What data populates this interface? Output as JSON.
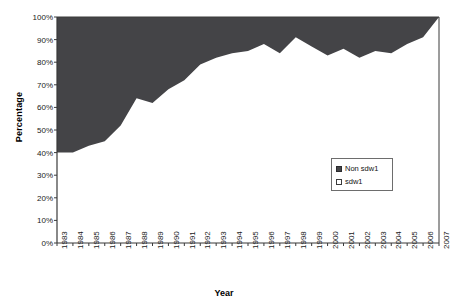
{
  "chart": {
    "type": "area",
    "title": "",
    "xlabel": "Year",
    "ylabel": "Percentage",
    "legend_position": "inside-right",
    "grid": false,
    "ylim": [
      0,
      100
    ],
    "ytick_labels": [
      "100%",
      "90%",
      "80%",
      "70%",
      "60%",
      "50%",
      "40%",
      "30%",
      "20%",
      "10%",
      "0%"
    ],
    "ytick_values": [
      100,
      90,
      80,
      70,
      60,
      50,
      40,
      30,
      20,
      10,
      0
    ],
    "legend": [
      {
        "label": "Non sdw1",
        "swatch": "filled",
        "color": "#444447"
      },
      {
        "label": "sdw1",
        "swatch": "empty",
        "color": "#ffffff"
      }
    ]
  },
  "chart_data": {
    "type": "area",
    "title": "",
    "xlabel": "Year",
    "ylabel": "Percentage",
    "ylim": [
      0,
      100
    ],
    "grid": false,
    "legend_position": "inside-right",
    "stacked": true,
    "categories": [
      "1983",
      "1984",
      "1985",
      "1986",
      "1987",
      "1988",
      "1989",
      "1990",
      "1991",
      "1992",
      "1993",
      "1994",
      "1995",
      "1996",
      "1997",
      "1998",
      "1999",
      "2000",
      "2001",
      "2002",
      "2003",
      "2004",
      "2005",
      "2006",
      "2007"
    ],
    "series": [
      {
        "name": "Non sdw1",
        "color": "#444447",
        "values": [
          40,
          40,
          43,
          45,
          52,
          64,
          62,
          68,
          72,
          79,
          82,
          84,
          85,
          88,
          84,
          91,
          87,
          83,
          86,
          82,
          85,
          84,
          88,
          91,
          100
        ]
      },
      {
        "name": "sdw1",
        "color": "#ffffff",
        "values": [
          60,
          60,
          57,
          55,
          48,
          36,
          38,
          32,
          28,
          21,
          18,
          16,
          15,
          12,
          16,
          9,
          13,
          17,
          14,
          18,
          15,
          16,
          12,
          9,
          0
        ]
      }
    ],
    "annotations": []
  }
}
